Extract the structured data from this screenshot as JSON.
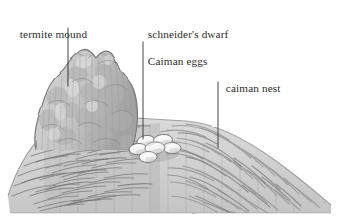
{
  "figure": {
    "style": "pencil-sketch greyscale scientific illustration",
    "width": 339,
    "height": 221,
    "background_color": "#ffffff"
  },
  "labels": [
    {
      "name": "termite-mound",
      "text": "termite mound",
      "lines": [
        "termite mound"
      ],
      "x": 8,
      "y": 14,
      "leader": {
        "x1": 68,
        "y1": 28,
        "x2": 68,
        "y2": 86
      }
    },
    {
      "name": "caiman-eggs",
      "text": "schneider's dwarf Caiman eggs",
      "lines": [
        "schneider's dwarf",
        "Caiman eggs"
      ],
      "x": 136,
      "y": 14,
      "leader": {
        "x1": 143,
        "y1": 42,
        "x2": 143,
        "y2": 139
      }
    },
    {
      "name": "caiman-nest",
      "text": "caiman nest",
      "lines": [
        "caiman nest"
      ],
      "x": 214,
      "y": 68,
      "leader": {
        "x1": 218,
        "y1": 82,
        "x2": 218,
        "y2": 148
      }
    }
  ],
  "colors": {
    "label_text": "#2b2b2b",
    "leader_line": "#3a3a3a",
    "termite_mound_fill": "#c9c9c9",
    "termite_mound_shadow": "#a8a8a8",
    "termite_mound_highlight": "#dedede",
    "nest_fill": "#d8d8d8",
    "nest_shadow": "#b4b4b4",
    "nest_strokes": "#8f8f8f",
    "egg_fill": "#fbfbfb",
    "egg_outline": "#6f6f6f"
  },
  "objects": {
    "termite_mound": {
      "name": "termite mound",
      "description": "tall irregular rocky mound on the left, lighter grey, vertically streaked",
      "bounds": {
        "x": 33,
        "y": 49,
        "width": 105,
        "height": 100
      }
    },
    "caiman_nest": {
      "name": "caiman nest",
      "description": "broad low mound of piled vegetation with fibrous grass strokes, darker shaded block on its left where the termite mound casts shade",
      "bounds": {
        "x": 8,
        "y": 118,
        "width": 323,
        "height": 96
      }
    },
    "eggs": {
      "name": "schneider's dwarf Caiman eggs",
      "description": "cluster of white oval eggs nestled in a hollow at the top of the nest",
      "count": 6,
      "center": {
        "x": 152,
        "y": 146
      },
      "positions": [
        {
          "cx": 146,
          "cy": 141,
          "rx": 9,
          "ry": 5.5,
          "rot": -8
        },
        {
          "cx": 163,
          "cy": 140,
          "rx": 9.5,
          "ry": 5.5,
          "rot": -4
        },
        {
          "cx": 138,
          "cy": 149,
          "rx": 9,
          "ry": 5.5,
          "rot": -6
        },
        {
          "cx": 155,
          "cy": 148,
          "rx": 10,
          "ry": 6,
          "rot": -3
        },
        {
          "cx": 172,
          "cy": 148,
          "rx": 9,
          "ry": 5.5,
          "rot": 2
        },
        {
          "cx": 148,
          "cy": 157,
          "rx": 9,
          "ry": 5.5,
          "rot": -2
        }
      ]
    }
  }
}
